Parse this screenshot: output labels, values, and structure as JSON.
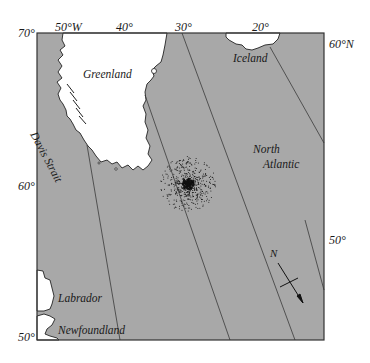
{
  "map": {
    "colors": {
      "ocean": "#a8a8a8",
      "land": "#ffffff",
      "frame": "#333333",
      "gridline": "#3a3a3a",
      "dots": "#111111"
    },
    "top_axis": {
      "corner_label": "70°",
      "ticks": [
        "50°W",
        "40°",
        "30°",
        "20°"
      ]
    },
    "left_axis": {
      "ticks": [
        "60°",
        "50°"
      ]
    },
    "right_axis": {
      "ticks": [
        "60°N",
        "50°"
      ]
    },
    "places": {
      "greenland": "Greenland",
      "iceland": "Iceland",
      "davis_strait": "Davis Strait",
      "north": "North",
      "atlantic": "Atlantic",
      "labrador": "Labrador",
      "newfoundland": "Newfoundland"
    },
    "compass": {
      "label": "N",
      "icon": "north-arrow-icon"
    },
    "feature": {
      "name": "dotted-point-cluster",
      "description": "dense stippled cluster in open ocean south-east of Greenland"
    }
  }
}
